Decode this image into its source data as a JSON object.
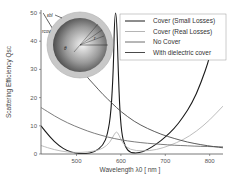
{
  "chart_data": {
    "type": "line",
    "title": "",
    "xlabel": "Wavelength λ0 [ nm ]",
    "ylabel": "Scattering Efficiency Qsc",
    "xlim": [
      420,
      830
    ],
    "ylim": [
      0,
      50
    ],
    "xticks": [
      500,
      600,
      700,
      800
    ],
    "yticks": [
      0,
      10,
      20,
      30,
      40,
      50
    ],
    "grid": false,
    "legend_position": "upper right",
    "series": [
      {
        "name": "Cover (Small Losses)",
        "color": "#1a1a1a",
        "x": [
          420,
          440,
          460,
          480,
          500,
          520,
          540,
          560,
          570,
          578,
          583,
          586,
          590,
          594,
          598,
          603,
          610,
          620,
          640,
          660,
          680,
          700,
          720,
          740,
          760,
          780,
          800,
          820
        ],
        "y": [
          10,
          6,
          3,
          1,
          0.2,
          0.1,
          0.6,
          3,
          7,
          15,
          30,
          50,
          50,
          30,
          14,
          6,
          2.5,
          0.5,
          0.3,
          1.5,
          3.5,
          6,
          9,
          13,
          18,
          25,
          34,
          48
        ]
      },
      {
        "name": "Cover (Real Losses)",
        "color": "#b5b5b5",
        "x": [
          420,
          450,
          480,
          510,
          540,
          560,
          575,
          585,
          590,
          595,
          605,
          620,
          650,
          680,
          710,
          740,
          770,
          800,
          830
        ],
        "y": [
          3,
          1.5,
          0.6,
          0.5,
          1,
          2,
          4,
          7,
          8,
          7,
          3.5,
          1.5,
          1,
          1.5,
          3,
          5,
          8,
          12,
          17
        ]
      },
      {
        "name": "No Cover",
        "color": "#6e6e6e",
        "x": [
          420,
          450,
          480,
          510,
          540,
          570,
          600,
          630,
          660,
          690,
          720,
          750,
          780,
          810,
          830
        ],
        "y": [
          16.5,
          13.5,
          11,
          9,
          7.3,
          6,
          5,
          4.3,
          3.8,
          3.4,
          3.1,
          2.9,
          2.7,
          2.6,
          2.5
        ]
      },
      {
        "name": "With dielectric cover",
        "color": "#4a4a4a",
        "x": [
          425,
          440,
          460,
          480,
          500,
          520,
          540,
          560,
          580,
          600,
          630,
          660,
          690,
          720,
          750,
          780,
          810,
          830
        ],
        "y": [
          50,
          46,
          41,
          36.5,
          32,
          28,
          24.5,
          21,
          18,
          15,
          11.5,
          9,
          7,
          5.5,
          4.2,
          3.3,
          2.6,
          2.2
        ]
      }
    ],
    "annotations": [
      "Inset: layered sphere schematic with core and dielectric shell, labels εbl, rcov, r, θ"
    ]
  },
  "inset": {
    "labels": [
      "εbl",
      "rcov",
      "r",
      "θ"
    ]
  }
}
